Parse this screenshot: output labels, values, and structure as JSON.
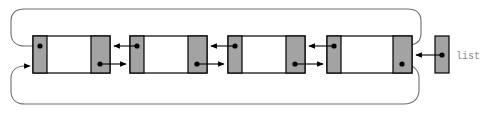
{
  "diagram": {
    "type": "linked-list-diagram",
    "canvas": {
      "width": 488,
      "height": 115
    },
    "colors": {
      "pointer_cell_fill": "#a3a3a3",
      "node_fill": "#ffffff",
      "stroke": "#000000",
      "loop_wire": "#6e6e6e",
      "label_text": "#8a8a8a"
    },
    "head_label": "list",
    "nodes": [
      {
        "id": "node-1",
        "index": 1,
        "x": 33,
        "y": 36,
        "width": 77,
        "height": 37,
        "prev_cell_width": 14,
        "next_cell_width": 19
      },
      {
        "id": "node-2",
        "index": 2,
        "x": 130,
        "y": 36,
        "width": 77,
        "height": 37,
        "prev_cell_width": 14,
        "next_cell_width": 19
      },
      {
        "id": "node-3",
        "index": 3,
        "x": 228,
        "y": 36,
        "width": 77,
        "height": 37,
        "prev_cell_width": 14,
        "next_cell_width": 19
      },
      {
        "id": "node-4",
        "index": 4,
        "x": 327,
        "y": 36,
        "width": 85,
        "height": 37,
        "prev_cell_width": 14,
        "next_cell_width": 19
      }
    ],
    "head_pointer": {
      "id": "head-box",
      "x": 435,
      "y": 36,
      "width": 14,
      "height": 37
    },
    "links": [
      {
        "id": "next-1-2",
        "from": "node-1",
        "to": "node-2",
        "direction": "right",
        "kind": "next"
      },
      {
        "id": "next-2-3",
        "from": "node-2",
        "to": "node-3",
        "direction": "right",
        "kind": "next"
      },
      {
        "id": "next-3-4",
        "from": "node-3",
        "to": "node-4",
        "direction": "right",
        "kind": "next"
      },
      {
        "id": "prev-2-1",
        "from": "node-2",
        "to": "node-1",
        "direction": "left",
        "kind": "prev"
      },
      {
        "id": "prev-3-2",
        "from": "node-3",
        "to": "node-2",
        "direction": "left",
        "kind": "prev"
      },
      {
        "id": "prev-4-3",
        "from": "node-4",
        "to": "node-3",
        "direction": "left",
        "kind": "prev"
      },
      {
        "id": "head-to-node-4",
        "from": "head-box",
        "to": "node-4",
        "direction": "left",
        "kind": "head"
      },
      {
        "id": "wrap-next-4-1",
        "from": "node-4",
        "to": "node-1",
        "direction": "wrap-bottom",
        "kind": "next"
      },
      {
        "id": "wrap-prev-1-4",
        "from": "node-1",
        "to": "node-4",
        "direction": "wrap-top",
        "kind": "prev"
      }
    ]
  }
}
